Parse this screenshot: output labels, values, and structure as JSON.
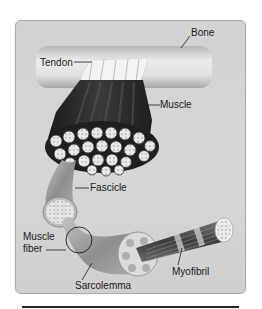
{
  "diagram": {
    "type": "anatomical-illustration",
    "labels": {
      "bone": "Bone",
      "tendon": "Tendon",
      "muscle": "Muscle",
      "fascicle": "Fascicle",
      "muscle_fiber_line1": "Muscle",
      "muscle_fiber_line2": "fiber",
      "sarcolemma": "Sarcolemma",
      "myofibril": "Myofibril"
    },
    "colors": {
      "panel_background": "#d4d4d4",
      "panel_border": "#a9a9a9",
      "bone": "#e6e6e6",
      "muscle": "#2b2b2b",
      "fiber": "#9a9a9a",
      "label_text": "#1a1a1a"
    }
  }
}
